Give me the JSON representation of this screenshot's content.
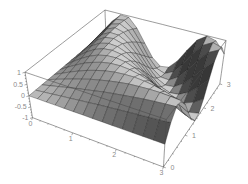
{
  "chart_data": {
    "type": "surface",
    "title": "",
    "x_axis": {
      "label": "",
      "range": [
        0,
        3
      ],
      "tick_values": [
        0,
        1,
        2,
        3
      ],
      "tick_labels": [
        "0",
        "1",
        "2",
        "3"
      ],
      "minor_tick_step": 0.2
    },
    "y_axis": {
      "label": "",
      "range": [
        0,
        3
      ],
      "tick_values": [
        0,
        1,
        2,
        3
      ],
      "tick_labels": [
        "0",
        "1",
        "2",
        "3"
      ],
      "minor_tick_step": 0.2
    },
    "z_axis": {
      "label": "",
      "range": [
        -1,
        1
      ],
      "tick_values": [
        1,
        0.5,
        0,
        -0.5,
        -1
      ],
      "tick_labels": [
        "1",
        "0.5",
        "0",
        "-0.5",
        "-1"
      ],
      "minor_tick_step": 0.125
    },
    "grid_size": 15,
    "x_values": [
      0,
      0.214,
      0.429,
      0.643,
      0.857,
      1.071,
      1.286,
      1.5,
      1.714,
      1.929,
      2.143,
      2.357,
      2.571,
      2.786,
      3
    ],
    "y_values": [
      0,
      0.214,
      0.429,
      0.643,
      0.857,
      1.071,
      1.286,
      1.5,
      1.714,
      1.929,
      2.143,
      2.357,
      2.571,
      2.786,
      3
    ],
    "z_grid": [
      [
        0,
        0,
        0,
        0,
        0,
        0,
        0,
        0,
        0,
        0,
        0,
        0,
        0,
        0,
        0
      ],
      [
        0,
        0.05,
        0.09,
        0.14,
        0.18,
        0.23,
        0.27,
        0.32,
        0.36,
        0.4,
        0.44,
        0.48,
        0.52,
        0.56,
        0.6
      ],
      [
        0,
        0.09,
        0.18,
        0.27,
        0.36,
        0.44,
        0.52,
        0.6,
        0.67,
        0.73,
        0.79,
        0.85,
        0.89,
        0.93,
        0.96
      ],
      [
        0,
        0.14,
        0.27,
        0.4,
        0.52,
        0.64,
        0.73,
        0.82,
        0.89,
        0.95,
        0.98,
        1.0,
        1.0,
        0.98,
        0.94
      ],
      [
        0,
        0.18,
        0.36,
        0.52,
        0.67,
        0.79,
        0.89,
        0.96,
        0.99,
        1.0,
        0.96,
        0.9,
        0.81,
        0.68,
        0.54
      ],
      [
        0,
        0.23,
        0.44,
        0.64,
        0.79,
        0.91,
        0.98,
        1.0,
        0.96,
        0.88,
        0.75,
        0.58,
        0.38,
        0.16,
        -0.07
      ],
      [
        0,
        0.27,
        0.52,
        0.73,
        0.89,
        0.98,
        1.0,
        0.94,
        0.81,
        0.61,
        0.38,
        0.11,
        -0.16,
        -0.43,
        -0.66
      ],
      [
        0,
        0.32,
        0.6,
        0.82,
        0.96,
        1.0,
        0.94,
        0.78,
        0.54,
        0.25,
        -0.07,
        -0.38,
        -0.66,
        -0.86,
        -0.98
      ],
      [
        0,
        0.36,
        0.67,
        0.89,
        0.99,
        0.96,
        0.81,
        0.54,
        0.2,
        -0.16,
        -0.51,
        -0.78,
        -0.95,
        -1.0,
        -0.91
      ],
      [
        0,
        0.4,
        0.73,
        0.95,
        1.0,
        0.88,
        0.61,
        0.25,
        -0.16,
        -0.55,
        -0.84,
        -0.99,
        -0.97,
        -0.79,
        -0.48
      ],
      [
        0,
        0.44,
        0.79,
        0.98,
        0.96,
        0.75,
        0.38,
        -0.07,
        -0.51,
        -0.84,
        -0.99,
        -0.94,
        -0.7,
        -0.31,
        0.14
      ],
      [
        0,
        0.48,
        0.85,
        1.0,
        0.9,
        0.58,
        0.11,
        -0.38,
        -0.78,
        -0.99,
        -0.94,
        -0.66,
        -0.22,
        0.28,
        0.71
      ],
      [
        0,
        0.52,
        0.89,
        1.0,
        0.81,
        0.38,
        -0.16,
        -0.66,
        -0.95,
        -0.97,
        -0.7,
        -0.22,
        0.32,
        0.77,
        0.99
      ],
      [
        0,
        0.56,
        0.93,
        0.98,
        0.68,
        0.16,
        -0.43,
        -0.86,
        -1.0,
        -0.79,
        -0.31,
        0.28,
        0.77,
        1.0,
        0.88
      ],
      [
        0,
        0.6,
        0.96,
        0.94,
        0.54,
        -0.07,
        -0.66,
        -0.98,
        -0.91,
        -0.48,
        0.14,
        0.71,
        0.99,
        0.88,
        0.41
      ]
    ],
    "layout_hints": {
      "view_point": [
        1.3,
        -2.4,
        2.0
      ],
      "box_ratios": [
        1,
        1,
        0.4
      ],
      "mesh": true,
      "boxed": true,
      "legend": "none"
    }
  },
  "style": {
    "background": "#ffffff",
    "mesh_line_color": "#1c1c1c",
    "box_edge_color": "#4a4a4a",
    "tick_color": "#555555",
    "label_color": "#8a8a8a",
    "surface_base_gray": "#c2c2c2",
    "surface_dark_gray": "#1a1a1a",
    "surface_light_gray": "#efefef"
  }
}
